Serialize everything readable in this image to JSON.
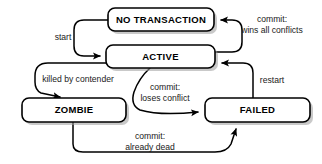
{
  "diagram": {
    "type": "state-diagram",
    "background_color": "#ffffff",
    "node_fill": "#ffffff",
    "node_stroke": "#000000",
    "edge_color": "#000000",
    "nodes": [
      {
        "id": "no_transaction",
        "label": "NO TRANSACTION",
        "x": 108,
        "y": 8,
        "w": 106,
        "h": 23
      },
      {
        "id": "active",
        "label": "ACTIVE",
        "x": 106,
        "y": 45,
        "w": 109,
        "h": 23
      },
      {
        "id": "zombie",
        "label": "ZOMBIE",
        "x": 22,
        "y": 98,
        "w": 104,
        "h": 24
      },
      {
        "id": "failed",
        "label": "FAILED",
        "x": 205,
        "y": 98,
        "w": 105,
        "h": 24
      }
    ],
    "edges": [
      {
        "id": "start",
        "from": "no_transaction",
        "to": "active",
        "label_lines": [
          "start"
        ],
        "label_x": 63,
        "label_y": 38
      },
      {
        "id": "commit_wins",
        "from": "active",
        "to": "no_transaction",
        "label_lines": [
          "commit:",
          "wins all conflicts"
        ],
        "label_x": 272,
        "label_y": 25
      },
      {
        "id": "killed_by_contender",
        "from": "active",
        "to": "zombie",
        "label_lines": [
          "killed by contender"
        ],
        "label_x": 78,
        "label_y": 80
      },
      {
        "id": "commit_loses",
        "from": "active",
        "to": "failed",
        "label_lines": [
          "commit:",
          "loses conflict"
        ],
        "label_x": 165,
        "label_y": 93
      },
      {
        "id": "restart",
        "from": "failed",
        "to": "active",
        "label_lines": [
          "restart"
        ],
        "label_x": 272,
        "label_y": 81
      },
      {
        "id": "commit_already_dead",
        "from": "zombie",
        "to": "failed",
        "label_lines": [
          "commit:",
          "already dead"
        ],
        "label_x": 150,
        "label_y": 142
      }
    ]
  }
}
